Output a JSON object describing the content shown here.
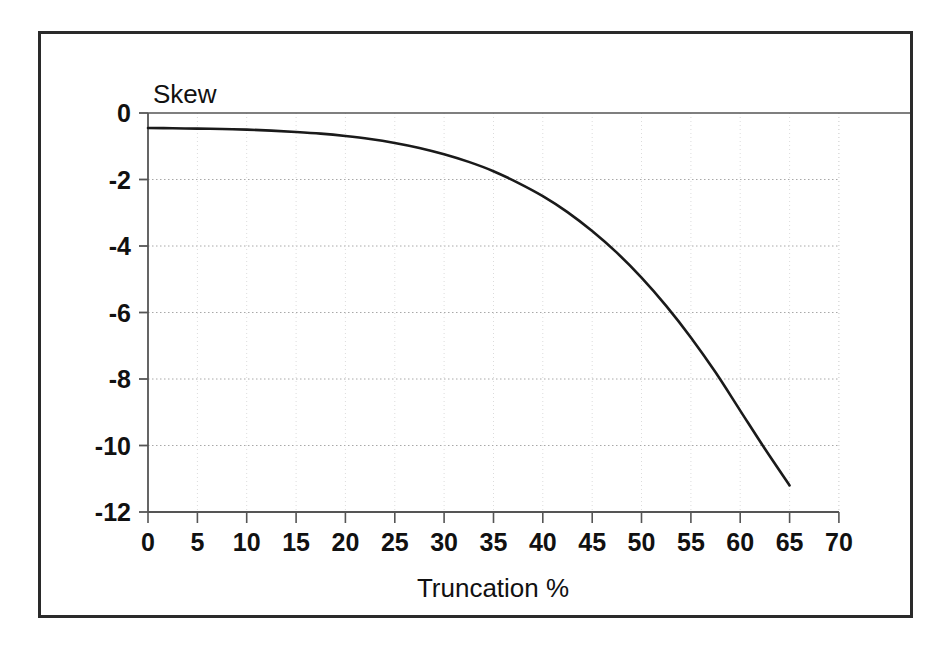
{
  "figure": {
    "background_color": "#ffffff",
    "frame_color": "#2a2a2a",
    "plot_line_color": "#1a1a1a",
    "gridline_color": "#bbbbbb",
    "axis_color": "#333333"
  },
  "chart_data": {
    "type": "line",
    "title": "",
    "xlabel": "Truncation %",
    "ylabel": "Skew",
    "xlim": [
      0,
      70
    ],
    "ylim": [
      -12,
      0
    ],
    "xticks": [
      0,
      5,
      10,
      15,
      20,
      25,
      30,
      35,
      40,
      45,
      50,
      55,
      60,
      65,
      70
    ],
    "yticks": [
      0,
      -2,
      -4,
      -6,
      -8,
      -10,
      -12
    ],
    "xtick_labels": [
      "0",
      "5",
      "10",
      "15",
      "20",
      "25",
      "30",
      "35",
      "40",
      "45",
      "50",
      "55",
      "60",
      "65",
      "70"
    ],
    "ytick_labels": [
      "0",
      "-2",
      "-4",
      "-6",
      "-8",
      "-10",
      "-12"
    ],
    "grid": true,
    "grid_style": "dotted",
    "legend": null,
    "series": [
      {
        "name": "Skew",
        "x": [
          0,
          2.5,
          5,
          7.5,
          10,
          12.5,
          15,
          17.5,
          20,
          22.5,
          25,
          27.5,
          30,
          32.5,
          35,
          37.5,
          40,
          42.5,
          45,
          47.5,
          50,
          52.5,
          55,
          57.5,
          60,
          62.5,
          65
        ],
        "y": [
          -0.45,
          -0.46,
          -0.47,
          -0.48,
          -0.5,
          -0.53,
          -0.57,
          -0.62,
          -0.69,
          -0.78,
          -0.9,
          -1.05,
          -1.24,
          -1.47,
          -1.75,
          -2.1,
          -2.5,
          -2.98,
          -3.55,
          -4.2,
          -4.95,
          -5.8,
          -6.75,
          -7.8,
          -8.95,
          -10.1,
          -11.2
        ]
      }
    ]
  },
  "labels": {
    "y_axis_title": "Skew",
    "x_axis_title": "Truncation %"
  }
}
